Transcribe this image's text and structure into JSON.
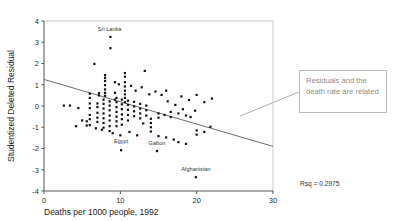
{
  "chart_data": {
    "type": "scatter",
    "title": "",
    "xlabel": "Deaths per 1000 people, 1992",
    "ylabel": "Studentized Deleted Residual",
    "xlim": [
      0,
      30
    ],
    "ylim": [
      -4,
      4
    ],
    "xticks": [
      0,
      10,
      20,
      30
    ],
    "yticks": [
      -4,
      -3,
      -2,
      -1,
      0,
      1,
      2,
      3,
      4
    ],
    "grid": false,
    "legend": null,
    "fit_line": {
      "x": [
        0,
        30
      ],
      "y": [
        1.25,
        -1.9
      ]
    },
    "annotations": [
      {
        "text": "Sri Lanka",
        "x": 8.6,
        "y": 3.55
      },
      {
        "text": "Egypt",
        "x": 10.1,
        "y": -1.75
      },
      {
        "text": "Gabon",
        "x": 14.8,
        "y": -1.82
      },
      {
        "text": "Afghanistan",
        "x": 19.9,
        "y": -3.05
      }
    ],
    "stat_label": "Rsq = 0.2975",
    "points": [
      [
        8.7,
        3.25
      ],
      [
        8.7,
        2.72
      ],
      [
        6.6,
        1.98
      ],
      [
        8.0,
        1.45
      ],
      [
        8.0,
        1.32
      ],
      [
        8.0,
        1.18
      ],
      [
        8.0,
        0.98
      ],
      [
        8.0,
        0.78
      ],
      [
        8.0,
        0.62
      ],
      [
        8.0,
        0.48
      ],
      [
        9.3,
        1.12
      ],
      [
        9.3,
        0.62
      ],
      [
        9.3,
        0.3
      ],
      [
        10.6,
        1.55
      ],
      [
        10.6,
        1.38
      ],
      [
        10.6,
        1.12
      ],
      [
        10.6,
        0.92
      ],
      [
        10.6,
        0.72
      ],
      [
        10.6,
        0.55
      ],
      [
        10.6,
        0.38
      ],
      [
        10.6,
        0.18
      ],
      [
        13.2,
        1.65
      ],
      [
        7.2,
        0.6
      ],
      [
        7.2,
        0.5
      ],
      [
        6.0,
        0.58
      ],
      [
        6.0,
        0.38
      ],
      [
        6.0,
        0.12
      ],
      [
        6.0,
        -0.1
      ],
      [
        6.0,
        -0.42
      ],
      [
        6.0,
        -0.62
      ],
      [
        6.0,
        -0.9
      ],
      [
        7.0,
        0.12
      ],
      [
        7.0,
        -0.05
      ],
      [
        7.0,
        -0.32
      ],
      [
        7.0,
        -0.55
      ],
      [
        7.0,
        -0.75
      ],
      [
        7.8,
        0.3
      ],
      [
        7.8,
        0.1
      ],
      [
        7.8,
        -0.12
      ],
      [
        7.8,
        -0.35
      ],
      [
        7.8,
        -0.58
      ],
      [
        7.8,
        -0.8
      ],
      [
        7.8,
        -1.02
      ],
      [
        8.6,
        0.22
      ],
      [
        8.6,
        0.02
      ],
      [
        8.6,
        -0.2
      ],
      [
        8.6,
        -0.45
      ],
      [
        8.6,
        -0.68
      ],
      [
        8.6,
        -0.95
      ],
      [
        8.6,
        -1.18
      ],
      [
        9.5,
        0.38
      ],
      [
        9.5,
        0.18
      ],
      [
        9.5,
        -0.05
      ],
      [
        9.5,
        -0.28
      ],
      [
        9.5,
        -0.5
      ],
      [
        9.5,
        -0.72
      ],
      [
        9.5,
        -0.95
      ],
      [
        10.2,
        0.3
      ],
      [
        10.2,
        0.08
      ],
      [
        10.2,
        -0.15
      ],
      [
        10.2,
        -0.4
      ],
      [
        10.2,
        -0.62
      ],
      [
        10.2,
        -0.88
      ],
      [
        11.0,
        0.25
      ],
      [
        11.0,
        0.05
      ],
      [
        11.0,
        -0.18
      ],
      [
        11.0,
        -0.42
      ],
      [
        11.0,
        -0.68
      ],
      [
        11.8,
        0.2
      ],
      [
        11.8,
        -0.02
      ],
      [
        11.8,
        -0.25
      ],
      [
        11.8,
        -0.48
      ],
      [
        12.6,
        0.1
      ],
      [
        12.6,
        -0.12
      ],
      [
        12.6,
        -0.35
      ],
      [
        12.6,
        -0.58
      ],
      [
        13.4,
        0.02
      ],
      [
        13.4,
        -0.2
      ],
      [
        13.4,
        -0.45
      ],
      [
        2.6,
        0.02
      ],
      [
        3.4,
        0.02
      ],
      [
        4.5,
        -0.1
      ],
      [
        5.0,
        -0.68
      ],
      [
        5.6,
        -0.72
      ],
      [
        5.6,
        -0.92
      ],
      [
        4.2,
        -0.95
      ],
      [
        6.8,
        -1.05
      ],
      [
        7.6,
        -1.12
      ],
      [
        9.0,
        -1.28
      ],
      [
        10.0,
        -1.38
      ],
      [
        11.2,
        -1.22
      ],
      [
        12.2,
        -1.38
      ],
      [
        13.0,
        -0.82
      ],
      [
        14.0,
        -0.6
      ],
      [
        14.0,
        -0.8
      ],
      [
        14.0,
        -1.0
      ],
      [
        14.0,
        -1.2
      ],
      [
        15.0,
        -0.35
      ],
      [
        15.0,
        -0.55
      ],
      [
        15.0,
        -1.42
      ],
      [
        15.8,
        -0.42
      ],
      [
        16.0,
        -1.48
      ],
      [
        16.6,
        -0.28
      ],
      [
        16.6,
        -0.52
      ],
      [
        17.0,
        -1.58
      ],
      [
        17.6,
        -0.35
      ],
      [
        17.6,
        -1.7
      ],
      [
        18.2,
        -0.15
      ],
      [
        18.6,
        -0.45
      ],
      [
        18.6,
        -1.78
      ],
      [
        19.2,
        -0.52
      ],
      [
        19.8,
        -0.22
      ],
      [
        20.0,
        -1.15
      ],
      [
        20.0,
        -1.35
      ],
      [
        21.0,
        -1.22
      ],
      [
        21.8,
        -0.98
      ],
      [
        16.2,
        0.22
      ],
      [
        17.2,
        0.05
      ],
      [
        18.0,
        0.45
      ],
      [
        19.0,
        0.28
      ],
      [
        20.0,
        0.52
      ],
      [
        21.0,
        0.18
      ],
      [
        22.0,
        0.35
      ],
      [
        14.6,
        0.68
      ],
      [
        15.4,
        0.52
      ],
      [
        16.0,
        0.72
      ],
      [
        13.8,
        0.55
      ],
      [
        19.9,
        -3.35
      ],
      [
        10.1,
        -2.08
      ],
      [
        14.8,
        -2.12
      ],
      [
        12.0,
        0.72
      ],
      [
        12.8,
        0.88
      ],
      [
        11.4,
        0.95
      ],
      [
        9.8,
        1.02
      ]
    ]
  },
  "callout": {
    "text": "Residuals and the death rate are related"
  }
}
